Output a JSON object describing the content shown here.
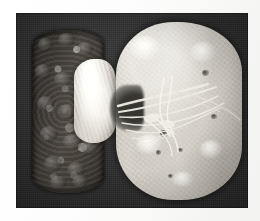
{
  "page": {
    "background_color": "#fbfbf9",
    "kind": "scanned-figure-page"
  },
  "figure": {
    "title": "",
    "caption": "",
    "modality": "gross-pathology-photograph",
    "color_mode": "grayscale",
    "plate": {
      "x": 16,
      "y": 13,
      "width": 232,
      "height": 195,
      "background_color": "#2f2f2f"
    },
    "specimens": [
      {
        "id": "left-specimen",
        "label": "",
        "position": "left",
        "description": "small dark nodular granular kidney",
        "surface": "coarsely-granular",
        "tone_color": "#4a4641",
        "attached_structure": {
          "id": "left-specimen-mass",
          "description": "pale fibrofatty hilar mass",
          "tone_color": "#cdc8bf"
        }
      },
      {
        "id": "right-specimen",
        "label": "",
        "position": "right",
        "description": "large pale smooth kidney",
        "surface": "smooth-mottled",
        "tone_color": "#bdb8ae",
        "attached_structure": {
          "id": "hilar-vessels",
          "description": "white hilar vessels and ureter strands",
          "tone_color": "#f2f0e8"
        }
      }
    ]
  },
  "overlays": {
    "annotations": [],
    "scale_bar": "",
    "arrows": []
  }
}
